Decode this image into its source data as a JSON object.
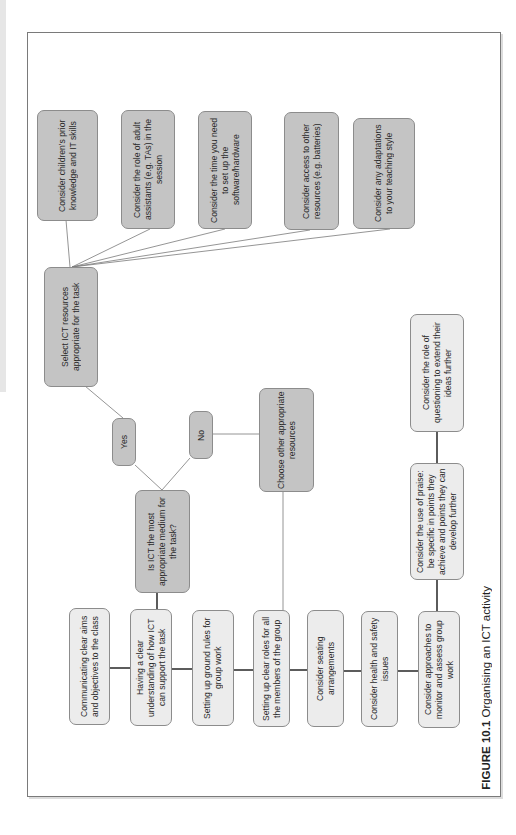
{
  "figure": {
    "caption_label": "FIGURE 10.1",
    "caption_text": " Organising an ICT activity"
  },
  "colors": {
    "dark_node": "#c4c4c4",
    "light_node": "#ececec",
    "border": "#8c8c8c",
    "line": "#555555"
  },
  "nodes": {
    "prior_knowledge": "Consider children's prior knowledge and IT skills",
    "adult_assistants": "Consider the role of adult assistants (e.g. TAs) in the session",
    "setup_time": "Consider the time you need to set up the software/hardware",
    "other_resources": "Consider access to other resources (e.g. batteries)",
    "teaching_style": "Consider any adaptations to your teaching style",
    "select_ict": "Select ICT resources appropriate for the task",
    "yes": "Yes",
    "no": "No",
    "choose_other": "Choose other appropriate resources",
    "is_ict": "Is ICT the most appropriate medium for the task?",
    "communicating": "Communicating clear aims and objectives to the class",
    "understanding": "Having a clear understanding of how ICT can support the task",
    "ground_rules": "Setting up ground rules for group work",
    "clear_roles": "Setting up clear roles for all the members of the group",
    "seating": "Consider seating arrangements",
    "health_safety": "Consider health and safety issues",
    "monitor_assess": "Consider approaches to monitor and assess group work",
    "praise": "Consider the use of praise: be specific in points they achieve and points they can develop further",
    "questioning": "Consider the role of questioning to extend their ideas further"
  }
}
